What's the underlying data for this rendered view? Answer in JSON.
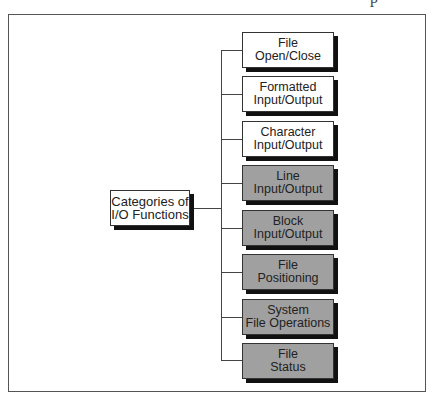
{
  "diagram": {
    "type": "tree",
    "root": {
      "label_line1": "Categories of",
      "label_line2": "I/O Functions"
    },
    "children": [
      {
        "line1": "File",
        "line2": "Open/Close",
        "shade": "white"
      },
      {
        "line1": "Formatted",
        "line2": "Input/Output",
        "shade": "white"
      },
      {
        "line1": "Character",
        "line2": "Input/Output",
        "shade": "white"
      },
      {
        "line1": "Line",
        "line2": "Input/Output",
        "shade": "gray"
      },
      {
        "line1": "Block",
        "line2": "Input/Output",
        "shade": "gray"
      },
      {
        "line1": "File",
        "line2": "Positioning",
        "shade": "gray"
      },
      {
        "line1": "System",
        "line2": "File Operations",
        "shade": "gray"
      },
      {
        "line1": "File",
        "line2": "Status",
        "shade": "gray"
      }
    ],
    "colors": {
      "white_box": "#ffffff",
      "gray_box": "#a0a0a0",
      "shadow": "#111111",
      "line": "#444444"
    }
  },
  "header_fragment": "p"
}
